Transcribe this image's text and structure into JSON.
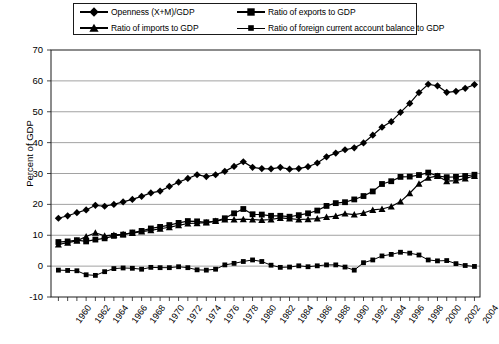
{
  "chart_data": {
    "type": "line",
    "title": "",
    "xlabel": "",
    "ylabel": "Percent of GDP",
    "xlim": [
      1959.2,
      2005.6
    ],
    "ylim": [
      -10,
      70
    ],
    "yticks": [
      -10,
      0,
      10,
      20,
      30,
      40,
      50,
      60,
      70
    ],
    "ytick_labels": [
      "-10",
      "0",
      "10",
      "20",
      "30",
      "40",
      "50",
      "60",
      "70"
    ],
    "xticks": [
      1960,
      1962,
      1964,
      1966,
      1968,
      1970,
      1972,
      1974,
      1976,
      1978,
      1980,
      1982,
      1984,
      1986,
      1988,
      1990,
      1992,
      1994,
      1996,
      1998,
      2000,
      2002,
      2004
    ],
    "xtick_labels": [
      "1960",
      "1962",
      "1964",
      "1966",
      "1968",
      "1970",
      "1972",
      "1974",
      "1976",
      "1978",
      "1980",
      "1982",
      "1984",
      "1986",
      "1988",
      "1990",
      "1992",
      "1994",
      "1996",
      "1998",
      "2000",
      "2002",
      "2004"
    ],
    "x_minor_every": 1,
    "grid": "horizontal",
    "legend_position": "top-center",
    "x": [
      1960,
      1961,
      1962,
      1963,
      1964,
      1965,
      1966,
      1967,
      1968,
      1969,
      1970,
      1971,
      1972,
      1973,
      1974,
      1975,
      1976,
      1977,
      1978,
      1979,
      1980,
      1981,
      1982,
      1983,
      1984,
      1985,
      1986,
      1987,
      1988,
      1989,
      1990,
      1991,
      1992,
      1993,
      1994,
      1995,
      1996,
      1997,
      1998,
      1999,
      2000,
      2001,
      2002,
      2003,
      2004,
      2005
    ],
    "series": [
      {
        "name": "Openness (X+M)/GDP",
        "marker": "diamond",
        "values": [
          15.5,
          16.3,
          17.3,
          18.2,
          19.7,
          19.4,
          20.0,
          20.8,
          21.6,
          22.6,
          23.7,
          24.3,
          25.8,
          27.2,
          28.4,
          29.6,
          29.0,
          29.6,
          30.7,
          32.3,
          33.8,
          32.0,
          31.6,
          31.5,
          32.0,
          31.4,
          31.6,
          32.2,
          33.4,
          35.4,
          36.6,
          37.7,
          38.3,
          39.9,
          42.4,
          45.0,
          46.8,
          49.8,
          52.7,
          56.2,
          58.9,
          58.4,
          56.3,
          56.6,
          57.6,
          58.8
        ]
      },
      {
        "name": "Ratio of exports to GDP",
        "marker": "square",
        "values": [
          7.8,
          8.0,
          8.4,
          8.0,
          8.6,
          9.0,
          9.8,
          10.2,
          10.9,
          11.4,
          12.2,
          12.7,
          13.3,
          14.0,
          14.6,
          14.5,
          14.2,
          14.6,
          15.5,
          17.1,
          18.5,
          16.8,
          16.7,
          16.3,
          16.3,
          16.0,
          16.5,
          17.1,
          18.0,
          19.5,
          20.4,
          20.7,
          21.6,
          22.7,
          24.2,
          26.6,
          27.5,
          28.9,
          29.0,
          29.5,
          30.3,
          29.2,
          28.8,
          28.9,
          29.2,
          29.6
        ]
      },
      {
        "name": "Ratio of imports to GDP",
        "marker": "triangle",
        "values": [
          7.0,
          7.6,
          8.2,
          9.6,
          10.8,
          9.8,
          10.1,
          10.3,
          10.7,
          11.2,
          11.6,
          12.1,
          12.6,
          13.2,
          13.8,
          13.9,
          14.1,
          14.6,
          15.1,
          15.1,
          15.2,
          15.1,
          14.9,
          15.1,
          15.6,
          15.4,
          15.1,
          15.2,
          15.4,
          15.9,
          16.2,
          17.0,
          16.7,
          17.2,
          18.2,
          18.5,
          19.3,
          20.9,
          23.6,
          26.7,
          28.6,
          29.2,
          27.5,
          27.7,
          28.4,
          29.2
        ]
      },
      {
        "name": "Ratio of foreign current account balance to GDP",
        "marker": "small-square",
        "values": [
          -1.3,
          -1.4,
          -1.5,
          -2.8,
          -3.0,
          -1.8,
          -0.8,
          -0.6,
          -0.7,
          -1.0,
          -0.4,
          -0.5,
          -0.5,
          -0.2,
          -0.5,
          -1.2,
          -1.3,
          -1.0,
          0.4,
          0.9,
          1.5,
          2.0,
          1.5,
          0.3,
          -0.4,
          -0.3,
          0.1,
          -0.2,
          0.1,
          0.4,
          0.4,
          -0.3,
          -1.3,
          1.1,
          2.0,
          3.3,
          3.8,
          4.5,
          4.2,
          3.6,
          2.0,
          1.7,
          1.8,
          0.8,
          0.2,
          -0.1
        ]
      }
    ]
  }
}
